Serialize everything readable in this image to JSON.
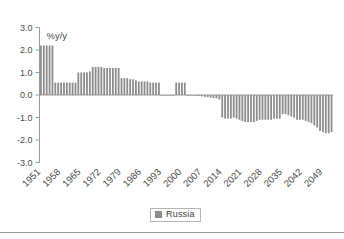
{
  "chart_data": {
    "type": "bar",
    "title": "",
    "subtitle": "",
    "xlabel": "",
    "ylabel": "%y/y",
    "axis_note": "%y/y",
    "ylim": [
      -3.0,
      3.0
    ],
    "ytick_labels": [
      "3.0",
      "2.0",
      "1.0",
      "0.0",
      "-1.0",
      "-2.0",
      "-3.0"
    ],
    "ytick_values": [
      3.0,
      2.0,
      1.0,
      0.0,
      -1.0,
      -2.0,
      -3.0
    ],
    "xtick_labels": [
      "1951",
      "1958",
      "1965",
      "1972",
      "1979",
      "1986",
      "1993",
      "2000",
      "2007",
      "2014",
      "2021",
      "2028",
      "2035",
      "2042",
      "2049"
    ],
    "xtick_years": [
      1951,
      1958,
      1965,
      1972,
      1979,
      1986,
      1993,
      2000,
      2007,
      2014,
      2021,
      2028,
      2035,
      2042,
      2049
    ],
    "grid": false,
    "legend_position": "bottom",
    "legend": [
      "Russia"
    ],
    "bar_color": "#8c8c8c",
    "axis_color": "#9a9a9a",
    "background": "#ffffff",
    "series": [
      {
        "name": "Russia",
        "x": [
          1951,
          1952,
          1953,
          1954,
          1955,
          1956,
          1957,
          1958,
          1959,
          1960,
          1961,
          1962,
          1963,
          1964,
          1965,
          1966,
          1967,
          1968,
          1969,
          1970,
          1971,
          1972,
          1973,
          1974,
          1975,
          1976,
          1977,
          1978,
          1979,
          1980,
          1981,
          1982,
          1983,
          1984,
          1985,
          1986,
          1987,
          1988,
          1989,
          1990,
          1991,
          1992,
          1993,
          1994,
          1995,
          1996,
          1997,
          1998,
          1999,
          2000,
          2001,
          2002,
          2003,
          2004,
          2005,
          2006,
          2007,
          2008,
          2009,
          2010,
          2011,
          2012,
          2013,
          2014,
          2015,
          2016,
          2017,
          2018,
          2019,
          2020,
          2021,
          2022,
          2023,
          2024,
          2025,
          2026,
          2027,
          2028,
          2029,
          2030,
          2031,
          2032,
          2033,
          2034,
          2035,
          2036,
          2037,
          2038,
          2039,
          2040,
          2041,
          2042,
          2043,
          2044,
          2045,
          2046,
          2047,
          2048,
          2049,
          2050,
          2051,
          2052
        ],
        "values": [
          2.2,
          2.2,
          2.2,
          2.2,
          2.2,
          0.55,
          0.55,
          0.55,
          0.55,
          0.55,
          0.55,
          0.55,
          0.55,
          1.0,
          1.0,
          1.0,
          1.0,
          1.05,
          1.25,
          1.25,
          1.25,
          1.25,
          1.2,
          1.2,
          1.2,
          1.2,
          1.2,
          1.2,
          0.75,
          0.75,
          0.75,
          0.7,
          0.7,
          0.65,
          0.6,
          0.6,
          0.6,
          0.6,
          0.55,
          0.55,
          0.55,
          0.55,
          0.0,
          0.0,
          0.0,
          0.0,
          0.0,
          0.55,
          0.55,
          0.55,
          0.55,
          0.0,
          -0.02,
          -0.03,
          -0.04,
          -0.05,
          -0.06,
          -0.08,
          -0.1,
          -0.12,
          -0.14,
          -0.15,
          -0.2,
          -1.0,
          -1.05,
          -1.05,
          -1.05,
          -1.0,
          -1.05,
          -1.1,
          -1.15,
          -1.2,
          -1.2,
          -1.2,
          -1.2,
          -1.15,
          -1.1,
          -1.1,
          -1.1,
          -1.1,
          -1.1,
          -1.05,
          -1.05,
          -1.05,
          -0.85,
          -0.85,
          -0.9,
          -0.95,
          -1.0,
          -1.1,
          -1.1,
          -1.1,
          -1.15,
          -1.2,
          -1.25,
          -1.35,
          -1.45,
          -1.6,
          -1.65,
          -1.7,
          -1.7,
          -1.65
        ]
      }
    ]
  }
}
